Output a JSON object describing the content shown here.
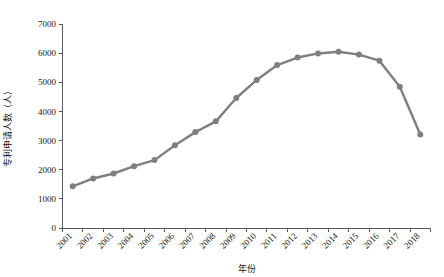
{
  "chart_data": {
    "type": "line",
    "title": "",
    "xlabel": "年份",
    "ylabel": "专利申请人数（人）",
    "categories": [
      "2001",
      "2002",
      "2003",
      "2004",
      "2005",
      "2006",
      "2007",
      "2008",
      "2009",
      "2010",
      "2011",
      "2012",
      "2013",
      "2014",
      "2015",
      "2016",
      "2017",
      "2018"
    ],
    "values": [
      1430,
      1700,
      1870,
      2120,
      2330,
      2840,
      3290,
      3660,
      4460,
      5080,
      5590,
      5850,
      5990,
      6050,
      5950,
      5740,
      4850,
      3210
    ],
    "series": [
      {
        "name": "专利申请人数",
        "values": [
          1430,
          1700,
          1870,
          2120,
          2330,
          2840,
          3290,
          3660,
          4460,
          5080,
          5590,
          5850,
          5990,
          6050,
          5950,
          5740,
          4850,
          3210
        ]
      }
    ],
    "x": [
      "2001",
      "2002",
      "2003",
      "2004",
      "2005",
      "2006",
      "2007",
      "2008",
      "2009",
      "2010",
      "2011",
      "2012",
      "2013",
      "2014",
      "2015",
      "2016",
      "2017",
      "2018"
    ],
    "ylim": [
      0,
      7000
    ],
    "ytick_step": 1000,
    "yticks": [
      "0",
      "1000",
      "2000",
      "3000",
      "4000",
      "5000",
      "6000",
      "7000"
    ],
    "ytick_values": [
      0,
      1000,
      2000,
      3000,
      4000,
      5000,
      6000,
      7000
    ],
    "xtick_labels": [
      "2001",
      "2002",
      "2003",
      "2004",
      "2005",
      "2006",
      "2007",
      "2008",
      "2009",
      "2010",
      "2011",
      "2012",
      "2013",
      "2014",
      "2015",
      "2016",
      "2017",
      "2018"
    ],
    "xtick_rotation": -45,
    "grid": false,
    "legend": false,
    "legend_position": "none",
    "colors": {
      "line": "#7f7f7f",
      "marker": "#7f7f7f",
      "axis": "#595959",
      "text": "#1a1a1a",
      "background": "#ffffff"
    },
    "line_width": 2.4,
    "marker_radius": 3.0,
    "marker_shape": "circle"
  }
}
